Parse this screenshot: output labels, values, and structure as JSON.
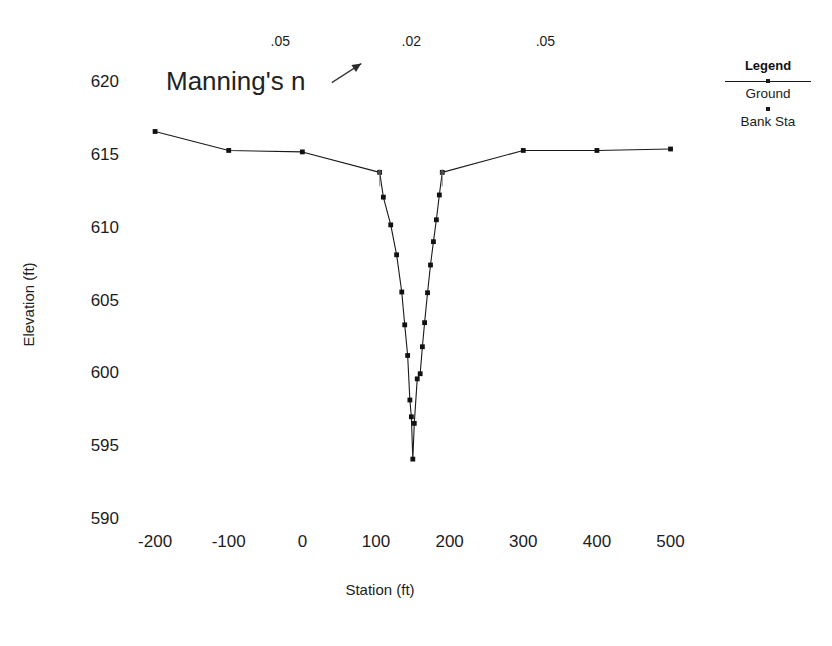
{
  "chart_data": {
    "type": "line",
    "title": "",
    "xlabel": "Station (ft)",
    "ylabel": "Elevation (ft)",
    "xlim": [
      -230,
      540
    ],
    "ylim": [
      589.0,
      621.0
    ],
    "xticks": [
      -200,
      -100,
      0,
      100,
      200,
      300,
      400,
      500
    ],
    "yticks": [
      590,
      595,
      600,
      605,
      610,
      615,
      620
    ],
    "grid": false,
    "legend_position": "top-right",
    "series": [
      {
        "name": "Ground",
        "marker": "square",
        "x": [
          -200,
          -100,
          0,
          105,
          110,
          120,
          128,
          135,
          139,
          143,
          146,
          148,
          150,
          152,
          156,
          160,
          163,
          166,
          170,
          174,
          178,
          182,
          186,
          190,
          300,
          400,
          500
        ],
        "y": [
          616.65,
          615.35,
          615.25,
          613.85,
          612.15,
          610.25,
          608.2,
          605.65,
          603.4,
          601.3,
          598.25,
          597.1,
          594.2,
          596.65,
          599.7,
          600.05,
          601.9,
          603.55,
          605.6,
          607.5,
          609.1,
          610.6,
          612.3,
          613.85,
          615.35,
          615.35,
          615.45
        ]
      },
      {
        "name": "Bank Sta",
        "marker": "dot",
        "x": [
          105,
          190
        ],
        "y": [
          613.85,
          613.85
        ]
      }
    ],
    "annotations": {
      "manning_label": "Manning's n",
      "manning_values": [
        {
          "label": ".05",
          "station": -30
        },
        {
          "label": ".02",
          "station": 148
        },
        {
          "label": ".05",
          "station": 330
        }
      ],
      "arrow": {
        "from_station": 40,
        "from_elev": 620.0,
        "to_station": 80,
        "to_elev": 621.3
      }
    }
  },
  "legend": {
    "title": "Legend",
    "entries": [
      {
        "label": "Ground",
        "marker": "line-with-point"
      },
      {
        "label": "Bank Sta",
        "marker": "dot"
      }
    ]
  },
  "colors": {
    "line": "#1a1a1a",
    "marker": "#111111",
    "text": "#1c1c1c",
    "background": "#ffffff"
  }
}
